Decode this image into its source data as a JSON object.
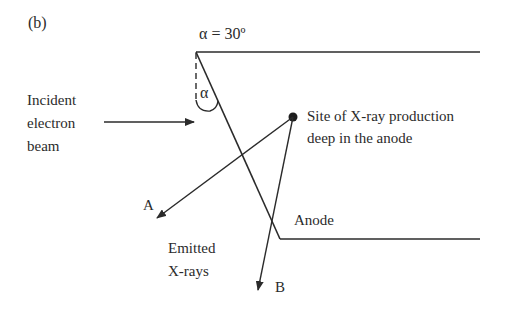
{
  "panel_label": "(b)",
  "angle_label": "α = 30º",
  "angle_symbol": "α",
  "incident": {
    "line1": "Incident",
    "line2": "electron",
    "line3": "beam"
  },
  "site": {
    "line1": "Site of X-ray production",
    "line2": "deep in the anode"
  },
  "anode_label": "Anode",
  "emitted": {
    "line1": "Emitted",
    "line2": "X-rays"
  },
  "ray_a_label": "A",
  "ray_b_label": "B",
  "colors": {
    "ink": "#2b2b2b",
    "background": "#ffffff"
  }
}
